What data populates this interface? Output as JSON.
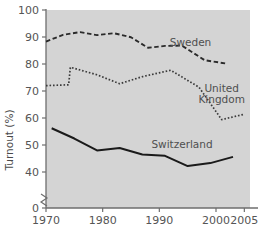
{
  "chart_data": {
    "type": "line",
    "title": "",
    "xlabel": "",
    "ylabel": "Turnout (%)",
    "xlim": [
      1970,
      2006
    ],
    "ylim": [
      38,
      100
    ],
    "y_axis_break": true,
    "y_break_from": 0,
    "y_break_to": 40,
    "grid": false,
    "legend_position": "inline-right",
    "background": "#d4d4d4",
    "xticks": [
      1970,
      1980,
      1990,
      2000,
      2005
    ],
    "xticklabels": [
      "1970",
      "1980",
      "1990",
      "2000",
      "2005"
    ],
    "yticks": [
      0,
      40,
      50,
      60,
      70,
      80,
      90,
      100
    ],
    "yticklabels": [
      "0",
      "40",
      "50",
      "60",
      "70",
      "80",
      "90",
      "100"
    ],
    "series": [
      {
        "name": "Sweden",
        "style": "dashed",
        "color": "#2b2b2b",
        "label": "Sweden",
        "x": [
          1970,
          1973,
          1976,
          1979,
          1982,
          1985,
          1988,
          1991,
          1994,
          1998,
          2002
        ],
        "values": [
          88.3,
          90.8,
          91.8,
          90.7,
          91.4,
          89.9,
          86.0,
          86.7,
          86.8,
          81.4,
          80.1
        ]
      },
      {
        "name": "United Kingdom",
        "style": "dotted",
        "color": "#3a3a3a",
        "label": "United Kingdom",
        "label_lines": [
          "United",
          "Kingdom"
        ],
        "x": [
          1970,
          1974.0,
          1974.3,
          1979,
          1983,
          1987,
          1992,
          1997,
          2001,
          2005
        ],
        "values": [
          72.0,
          72.3,
          78.8,
          76.0,
          72.7,
          75.3,
          77.7,
          71.4,
          59.4,
          61.4
        ]
      },
      {
        "name": "Switzerland",
        "style": "solid",
        "color": "#1a1a1a",
        "label": "Switzerland",
        "x": [
          1971,
          1975,
          1979,
          1983,
          1987,
          1991,
          1995,
          1999,
          2003
        ],
        "values": [
          56.2,
          52.4,
          48.0,
          48.9,
          46.5,
          46.0,
          42.2,
          43.3,
          45.6
        ]
      }
    ],
    "annotations": [
      {
        "text": "Sweden",
        "x": 1995.5,
        "y": 86.5
      },
      {
        "text": "United Kingdom",
        "x": 2001.0,
        "y": 69.5
      },
      {
        "text": "Switzerland",
        "x": 1994.0,
        "y": 49.0
      }
    ]
  }
}
